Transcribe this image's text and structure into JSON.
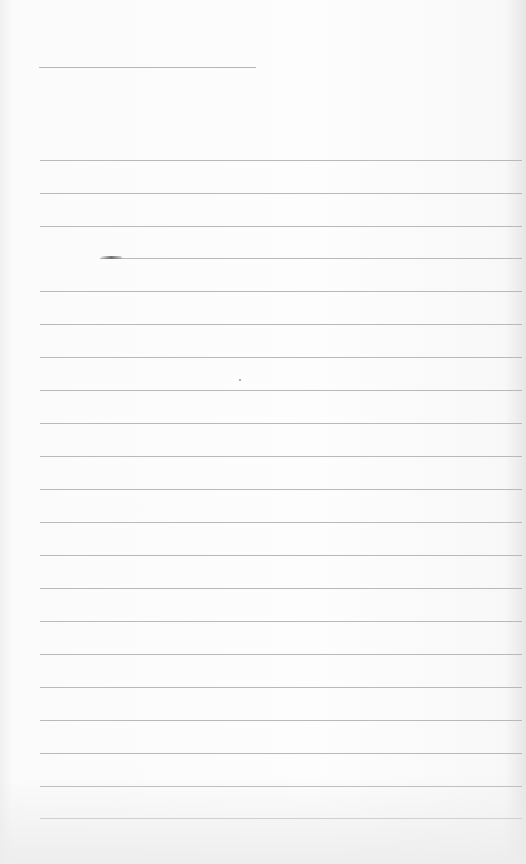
{
  "scene": {
    "description": "Blank sheet of lined notebook paper",
    "paper_color": "#fbfbfb",
    "rule_color": "#b9b9b9"
  },
  "title_rule": {
    "x": 39,
    "y": 67,
    "width": 217
  },
  "rules": [
    {
      "y": 160,
      "x": 40
    },
    {
      "y": 193,
      "x": 40
    },
    {
      "y": 226,
      "x": 40
    },
    {
      "y": 258,
      "x": 100
    },
    {
      "y": 291,
      "x": 40
    },
    {
      "y": 324,
      "x": 40
    },
    {
      "y": 357,
      "x": 40
    },
    {
      "y": 390,
      "x": 40
    },
    {
      "y": 423,
      "x": 40
    },
    {
      "y": 456,
      "x": 40
    },
    {
      "y": 489,
      "x": 40
    },
    {
      "y": 522,
      "x": 40
    },
    {
      "y": 555,
      "x": 40
    },
    {
      "y": 588,
      "x": 40
    },
    {
      "y": 621,
      "x": 40
    },
    {
      "y": 654,
      "x": 40
    },
    {
      "y": 687,
      "x": 40
    },
    {
      "y": 720,
      "x": 40
    },
    {
      "y": 753,
      "x": 40
    },
    {
      "y": 786,
      "x": 40
    },
    {
      "y": 818,
      "x": 40
    }
  ],
  "rules_right_edge": 522
}
